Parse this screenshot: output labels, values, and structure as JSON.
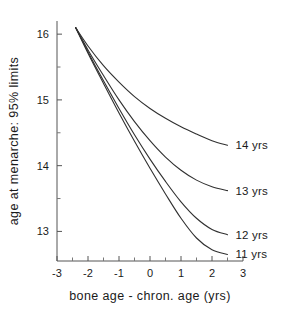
{
  "chart_data": {
    "type": "line",
    "title": "",
    "subtitle": "",
    "xlabel": "bone age - chron. age (yrs)",
    "ylabel": "age at menarche: 95% limits",
    "xlim": [
      -3,
      3
    ],
    "ylim": [
      12.55,
      16.2
    ],
    "grid": false,
    "legend_position": "right-of-curve-ends",
    "x_ticks": [
      -3,
      -2,
      -1,
      0,
      1,
      2,
      3
    ],
    "x_tick_labels": [
      "-3",
      "-2",
      "-1",
      "0",
      "1",
      "2",
      "3"
    ],
    "x_minor_ticks": [
      -2.5,
      -1.5,
      -0.5,
      0.5,
      1.5,
      2.5
    ],
    "y_ticks": [
      13,
      14,
      15,
      16
    ],
    "y_tick_labels": [
      "13",
      "14",
      "15",
      "16"
    ],
    "y_minor_ticks": [
      13.5,
      14.5,
      15.5
    ],
    "series": [
      {
        "name": "14 yrs",
        "label": "14 yrs",
        "color": "#303030",
        "x": [
          -2.4,
          -2.0,
          -1.5,
          -1.0,
          -0.5,
          0.0,
          0.5,
          1.0,
          1.5,
          2.0,
          2.5
        ],
        "values": [
          16.1,
          15.82,
          15.52,
          15.27,
          15.05,
          14.87,
          14.72,
          14.59,
          14.48,
          14.38,
          14.31
        ]
      },
      {
        "name": "13 yrs",
        "label": "13 yrs",
        "color": "#303030",
        "x": [
          -2.4,
          -2.0,
          -1.5,
          -1.0,
          -0.5,
          0.0,
          0.5,
          1.0,
          1.5,
          2.0,
          2.5
        ],
        "values": [
          16.1,
          15.76,
          15.37,
          15.0,
          14.67,
          14.38,
          14.13,
          13.93,
          13.78,
          13.68,
          13.62
        ]
      },
      {
        "name": "12 yrs",
        "label": "12 yrs",
        "color": "#303030",
        "x": [
          -2.4,
          -2.0,
          -1.5,
          -1.0,
          -0.5,
          0.0,
          0.5,
          1.0,
          1.5,
          2.0,
          2.5
        ],
        "values": [
          16.1,
          15.73,
          15.29,
          14.87,
          14.47,
          14.1,
          13.76,
          13.45,
          13.2,
          13.03,
          12.95
        ]
      },
      {
        "name": "11 yrs",
        "label": "11 yrs",
        "color": "#303030",
        "x": [
          -2.4,
          -2.0,
          -1.5,
          -1.0,
          -0.5,
          0.0,
          0.5,
          1.0,
          1.5,
          2.0,
          2.5
        ],
        "values": [
          16.1,
          15.71,
          15.25,
          14.8,
          14.37,
          13.96,
          13.57,
          13.2,
          12.9,
          12.72,
          12.65
        ]
      }
    ]
  }
}
